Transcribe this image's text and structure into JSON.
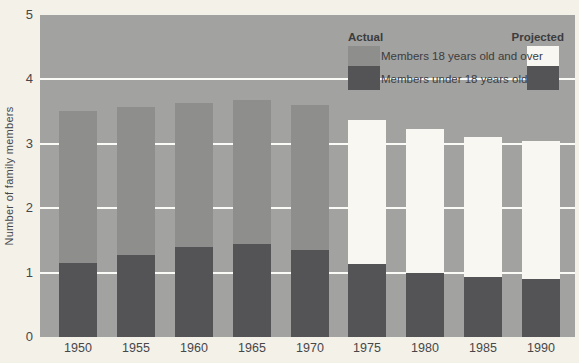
{
  "figure": {
    "background": "#f4f1e9",
    "plot_background": "#a2a2a0",
    "gridline_color": "#fafaf6",
    "text_color": "#47474a"
  },
  "colors": {
    "actual_over18": "#8e8e8c",
    "projected_over18": "#f8f7f2",
    "under18": "#545456"
  },
  "legend": {
    "actual_label": "Actual",
    "projected_label": "Projected",
    "over18_label": "Members 18 years old and over",
    "under18_label": "Members under 18 years old"
  },
  "chart_data": {
    "type": "bar",
    "stacked": true,
    "title": "",
    "xlabel": "",
    "ylabel": "Number of family members",
    "ylim": [
      0,
      5
    ],
    "yticks": [
      0,
      1,
      2,
      3,
      4,
      5
    ],
    "gridlines": [
      1,
      2,
      3,
      4
    ],
    "grid": true,
    "legend_position": "top-right-inside",
    "categories": [
      "1950",
      "1955",
      "1960",
      "1965",
      "1970",
      "1975",
      "1980",
      "1985",
      "1990"
    ],
    "status": [
      "actual",
      "actual",
      "actual",
      "actual",
      "actual",
      "projected",
      "projected",
      "projected",
      "projected"
    ],
    "series": [
      {
        "name": "Members under 18 years old",
        "values": [
          1.15,
          1.28,
          1.4,
          1.45,
          1.35,
          1.13,
          1.0,
          0.93,
          0.9
        ]
      },
      {
        "name": "Members 18 years old and over",
        "values": [
          2.36,
          2.29,
          2.24,
          2.23,
          2.25,
          2.24,
          2.23,
          2.18,
          2.14
        ]
      }
    ],
    "totals": [
      3.51,
      3.57,
      3.64,
      3.68,
      3.6,
      3.37,
      3.23,
      3.11,
      3.04
    ]
  }
}
